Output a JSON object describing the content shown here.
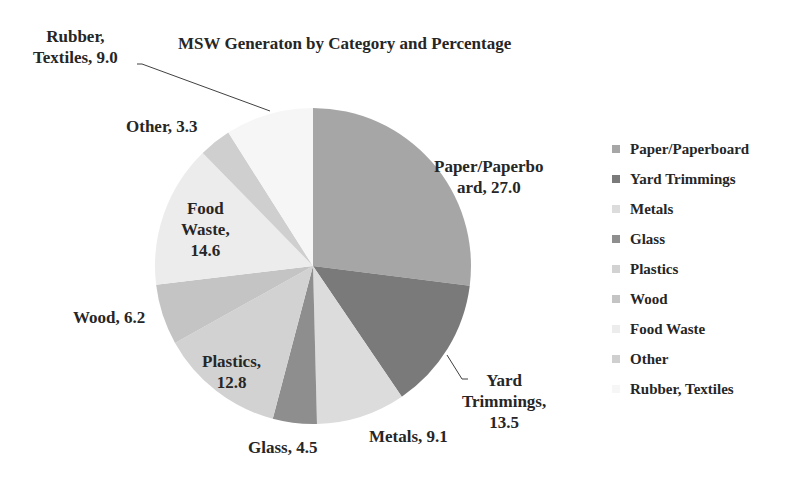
{
  "chart_data": {
    "type": "pie",
    "title": "MSW Generaton by Category and Percentage",
    "categories": [
      "Paper/Paperboard",
      "Yard Trimmings",
      "Metals",
      "Glass",
      "Plastics",
      "Wood",
      "Food Waste",
      "Other",
      "Rubber, Textiles"
    ],
    "values": [
      27.0,
      13.5,
      9.1,
      4.5,
      12.8,
      6.2,
      14.6,
      3.3,
      9.0
    ],
    "colors": [
      "#a6a6a6",
      "#7a7a7a",
      "#dcdcdc",
      "#8e8e8e",
      "#d2d2d2",
      "#c4c4c4",
      "#ececec",
      "#cfcfcf",
      "#f6f6f6"
    ],
    "data_labels": [
      "Paper/Paperbo ard, 27.0",
      "Yard Trimmings, 13.5",
      "Metals, 9.1",
      "Glass, 4.5",
      "Plastics, 12.8",
      "Wood, 6.2",
      "Food Waste, 14.6",
      "Other, 3.3",
      "Rubber, Textiles, 9.0"
    ],
    "start_angle": "12 o'clock",
    "direction": "clockwise",
    "legend_position": "right"
  },
  "labels": {
    "paper_l1": "Paper/Paperbo",
    "paper_l2": "ard, 27.0",
    "yard_l1": "Yard",
    "yard_l2": "Trimmings,",
    "yard_l3": "13.5",
    "metals": "Metals, 9.1",
    "glass": "Glass, 4.5",
    "plastics_l1": "Plastics,",
    "plastics_l2": "12.8",
    "wood": "Wood, 6.2",
    "food_l1": "Food",
    "food_l2": "Waste,",
    "food_l3": "14.6",
    "other": "Other, 3.3",
    "rubber_l1": "Rubber,",
    "rubber_l2": "Textiles, 9.0"
  },
  "legend": {
    "items": [
      {
        "label": "Paper/Paperboard",
        "color": "#a6a6a6"
      },
      {
        "label": "Yard Trimmings",
        "color": "#7a7a7a"
      },
      {
        "label": "Metals",
        "color": "#dcdcdc"
      },
      {
        "label": "Glass",
        "color": "#8e8e8e"
      },
      {
        "label": "Plastics",
        "color": "#d2d2d2"
      },
      {
        "label": "Wood",
        "color": "#c4c4c4"
      },
      {
        "label": "Food Waste",
        "color": "#ececec"
      },
      {
        "label": "Other",
        "color": "#cfcfcf"
      },
      {
        "label": "Rubber, Textiles",
        "color": "#f6f6f6"
      }
    ]
  }
}
